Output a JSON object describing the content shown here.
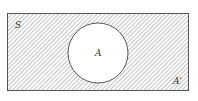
{
  "diagram": {
    "type": "venn",
    "universe_label": "S",
    "set_label": "A",
    "complement_label": "A'",
    "shaded_region": "complement",
    "colors": {
      "stroke": "#555555",
      "hatch": "#8a8a8a",
      "background": "#ffffff"
    }
  }
}
